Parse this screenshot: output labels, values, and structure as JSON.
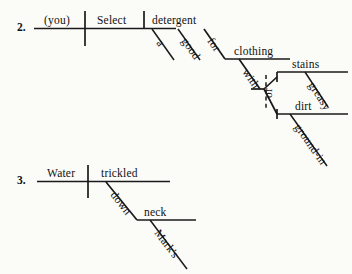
{
  "page": {
    "background_color": "#fbfbf8",
    "ink_color": "#111111",
    "type": "reed-kellogg-sentence-diagrams"
  },
  "diagrams": [
    {
      "number": "2.",
      "sentence": "(You) Select a good detergent for clothing with stains or ground-in dirt.",
      "words": {
        "subject": "(you)",
        "verb": "Select",
        "object": "detergent",
        "article": "a",
        "adjective": "good",
        "preposition1": "for",
        "prep1_object": "clothing",
        "preposition2": "with",
        "compound_a": "stains",
        "compound_b": "dirt",
        "conjunction": "or",
        "modifier_a": "greasy",
        "modifier_b": "ground-in"
      }
    },
    {
      "number": "3.",
      "sentence": "Water trickled down Mark's neck.",
      "words": {
        "subject": "Water",
        "verb": "trickled",
        "preposition": "down",
        "prep_object": "neck",
        "possessive": "Mark's"
      }
    }
  ]
}
